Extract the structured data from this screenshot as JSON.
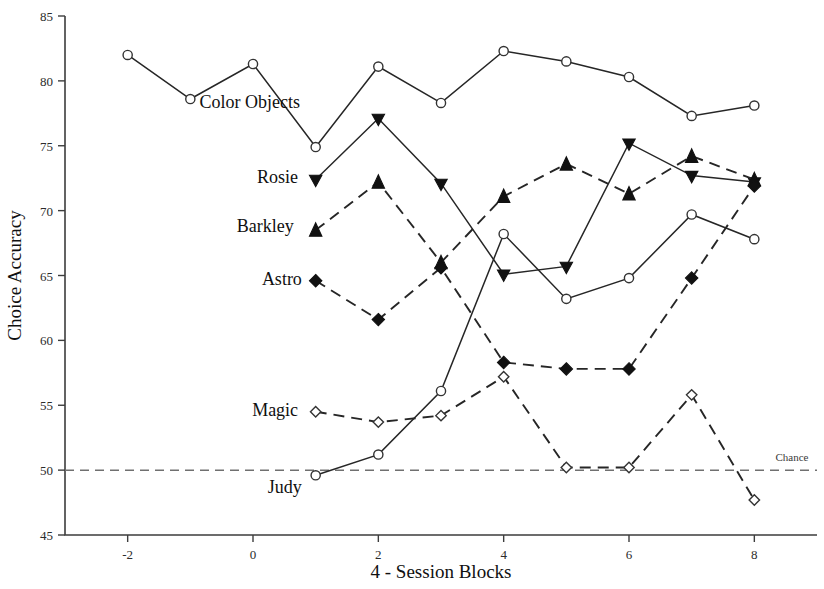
{
  "chart_data": {
    "type": "line",
    "title": "",
    "xlabel": "4 - Session Blocks",
    "ylabel": "Choice Accuracy",
    "xlim": [
      -3,
      9
    ],
    "ylim": [
      45,
      85
    ],
    "xticks": [
      -2,
      0,
      2,
      4,
      6,
      8
    ],
    "xtick_labels": [
      "-2",
      "0",
      "2",
      "4",
      "6",
      "8"
    ],
    "yticks": [
      45,
      50,
      55,
      60,
      65,
      70,
      75,
      80,
      85
    ],
    "ytick_labels": [
      "45",
      "50",
      "55",
      "60",
      "65",
      "70",
      "75",
      "80",
      "85"
    ],
    "grid": false,
    "legend_position": "inline-labels",
    "annotations": [
      {
        "text": "Chance",
        "x": 8.6,
        "y": 50.7
      }
    ],
    "reference_lines": [
      {
        "label": "Chance",
        "y": 50,
        "style": "dashed",
        "color": "#707070"
      }
    ],
    "series": [
      {
        "name": "Color Objects",
        "marker": "open-circle",
        "line": "solid",
        "label_x": 0.75,
        "label_y": 78.4,
        "x": [
          -2,
          -1,
          0,
          1,
          2,
          3,
          4,
          5,
          6,
          7,
          8
        ],
        "values": [
          82.0,
          78.6,
          81.3,
          74.9,
          81.1,
          78.3,
          82.3,
          81.5,
          80.3,
          77.3,
          78.1
        ]
      },
      {
        "name": "Rosie",
        "marker": "filled-down-triangle",
        "line": "solid",
        "label_x": 0.72,
        "label_y": 72.6,
        "x": [
          1,
          2,
          3,
          4,
          5,
          6,
          7,
          8
        ],
        "values": [
          72.4,
          77.1,
          72.1,
          65.1,
          65.7,
          75.2,
          72.7,
          72.2
        ]
      },
      {
        "name": "Barkley",
        "marker": "filled-up-triangle",
        "line": "dashed",
        "label_x": 0.65,
        "label_y": 68.8,
        "x": [
          1,
          2,
          3,
          4,
          5,
          6,
          7,
          8
        ],
        "values": [
          68.5,
          72.2,
          66.0,
          71.1,
          73.6,
          71.3,
          74.2,
          72.4
        ]
      },
      {
        "name": "Astro",
        "marker": "filled-diamond",
        "line": "dashed",
        "label_x": 0.78,
        "label_y": 64.7,
        "x": [
          1,
          2,
          3,
          4,
          5,
          6,
          7,
          8
        ],
        "values": [
          64.6,
          61.6,
          65.6,
          58.3,
          57.8,
          57.8,
          64.8,
          71.9
        ]
      },
      {
        "name": "Magic",
        "marker": "open-diamond",
        "line": "dashed",
        "label_x": 0.72,
        "label_y": 54.6,
        "x": [
          1,
          2,
          3,
          4,
          5,
          6,
          7,
          8
        ],
        "values": [
          54.5,
          53.7,
          54.2,
          57.2,
          50.2,
          50.2,
          55.8,
          47.7
        ]
      },
      {
        "name": "Judy",
        "marker": "open-circle",
        "line": "solid",
        "label_x": 0.78,
        "label_y": 48.7,
        "x": [
          1,
          2,
          3,
          4,
          5,
          6,
          7,
          8
        ],
        "values": [
          49.6,
          51.2,
          56.1,
          68.2,
          63.2,
          64.8,
          69.7,
          67.8
        ]
      }
    ]
  }
}
